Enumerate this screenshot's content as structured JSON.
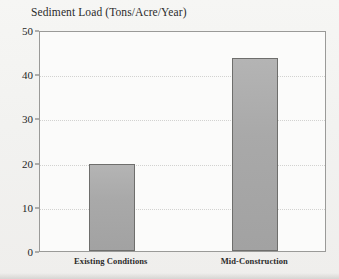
{
  "chart_data": {
    "type": "bar",
    "title": "Sediment Load (Tons/Acre/Year)",
    "xlabel": "",
    "ylabel": "",
    "categories": [
      "Existing Conditions",
      "Mid-Construction"
    ],
    "values": [
      19.7,
      43.7
    ],
    "ylim": [
      0,
      50
    ],
    "yticks": [
      0,
      10,
      20,
      30,
      40,
      50
    ],
    "ytick_labels": [
      "0",
      "10",
      "20",
      "30",
      "40",
      "50"
    ],
    "grid": true,
    "grid_axis": "y",
    "grid_style": "dotted",
    "legend": false,
    "series": [
      {
        "name": "Sediment Load",
        "values": [
          19.7,
          43.7
        ]
      }
    ],
    "colors": {
      "bar_fill": "#a9a9a9",
      "bar_edge": "#6e6e6c",
      "plot_background": "#fbfbfa",
      "figure_background": "#f2f2f0",
      "axis": "#9a9a98",
      "gridline": "#d2d2d0",
      "text": "#1f1f1f"
    }
  }
}
